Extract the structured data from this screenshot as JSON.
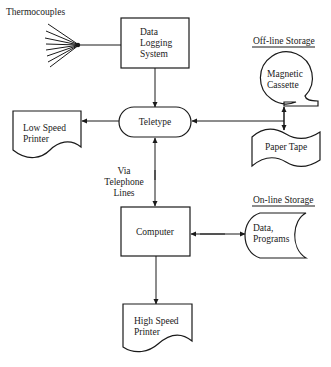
{
  "diagram": {
    "type": "system block diagram",
    "nodes": {
      "thermocouples": {
        "label": "Thermocouples"
      },
      "data_logging": {
        "lines": [
          "Data",
          "Logging",
          "System"
        ]
      },
      "teletype": {
        "label": "Teletype"
      },
      "low_speed_printer": {
        "lines": [
          "Low Speed",
          "Printer"
        ]
      },
      "offline_storage": {
        "heading": "Off-line Storage"
      },
      "magnetic_cassette": {
        "lines": [
          "Magnetic",
          "Cassette"
        ]
      },
      "paper_tape": {
        "label": "Paper Tape"
      },
      "telephone": {
        "lines": [
          "Via",
          "Telephone",
          "Lines"
        ]
      },
      "computer": {
        "label": "Computer"
      },
      "online_storage": {
        "heading": "On-line Storage"
      },
      "data_programs": {
        "lines": [
          "Data,",
          "Programs"
        ]
      },
      "high_speed_printer": {
        "lines": [
          "High Speed",
          "Printer"
        ]
      }
    },
    "edges": [
      {
        "from": "thermocouples",
        "to": "data_logging"
      },
      {
        "from": "data_logging",
        "to": "teletype"
      },
      {
        "from": "teletype",
        "to": "low_speed_printer"
      },
      {
        "from": "offline_storage",
        "to": "teletype"
      },
      {
        "from": "teletype",
        "to": "computer",
        "bidirectional": true,
        "via": "telephone"
      },
      {
        "from": "computer",
        "to": "data_programs",
        "bidirectional": true
      },
      {
        "from": "computer",
        "to": "high_speed_printer"
      }
    ]
  }
}
